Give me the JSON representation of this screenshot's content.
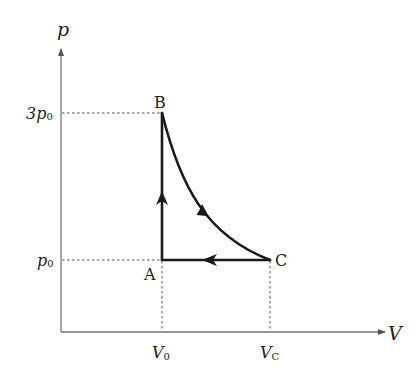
{
  "diagram": {
    "type": "p-V diagram",
    "axes": {
      "y_label": "p",
      "x_label": "V",
      "y_ticks": [
        {
          "label_main": "3p",
          "label_sub": "0",
          "value": "3p0"
        },
        {
          "label_main": "p",
          "label_sub": "0",
          "value": "p0"
        }
      ],
      "x_ticks": [
        {
          "label_main": "V",
          "label_sub": "0",
          "value": "V0"
        },
        {
          "label_main": "V",
          "label_sub": "C",
          "value": "VC"
        }
      ]
    },
    "points": [
      {
        "name": "A",
        "V": "V0",
        "p": "p0"
      },
      {
        "name": "B",
        "V": "V0",
        "p": "3p0"
      },
      {
        "name": "C",
        "V": "VC",
        "p": "p0"
      }
    ],
    "processes": [
      {
        "from": "A",
        "to": "B",
        "kind": "isochoric (vertical line)",
        "direction": "up"
      },
      {
        "from": "B",
        "to": "C",
        "kind": "curve (expansion)",
        "direction": "down-right"
      },
      {
        "from": "C",
        "to": "A",
        "kind": "isobaric (horizontal line)",
        "direction": "left"
      }
    ],
    "colors": {
      "axis": "#666666",
      "cycle": "#1a1a1a",
      "guides": "#555555",
      "text": "#222222"
    }
  }
}
